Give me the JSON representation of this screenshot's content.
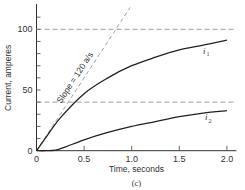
{
  "chart_data": {
    "type": "line",
    "title": "",
    "caption": "(c)",
    "xlabel": "Time, seconds",
    "ylabel": "Current, amperes",
    "xlim": [
      0,
      2.1
    ],
    "ylim": [
      0,
      120
    ],
    "x_ticks": [
      "0",
      "0.5",
      "1.0",
      "1.5",
      "2.0"
    ],
    "y_ticks": [
      "0",
      "50",
      "100"
    ],
    "y_minor_tick_step": 10,
    "grid": false,
    "reference_lines": [
      {
        "type": "horizontal",
        "y": 100,
        "style": "dashed"
      },
      {
        "type": "horizontal",
        "y": 40,
        "style": "dashed"
      },
      {
        "type": "slope",
        "slope": 120,
        "label": "Slope = 120 a/s",
        "style": "dashed"
      }
    ],
    "series": [
      {
        "name": "i1",
        "label": "i",
        "subscript": "1",
        "x": [
          0,
          0.1,
          0.25,
          0.5,
          0.75,
          1.0,
          1.25,
          1.5,
          1.75,
          2.0
        ],
        "values": [
          0,
          11,
          27,
          47,
          60,
          70,
          77,
          83,
          87,
          91
        ]
      },
      {
        "name": "i2",
        "label": "i",
        "subscript": "2",
        "x": [
          0,
          0.1,
          0.2,
          0.3,
          0.5,
          0.75,
          1.0,
          1.25,
          1.5,
          1.75,
          2.0
        ],
        "values": [
          0,
          0,
          0.5,
          3,
          9,
          15,
          20,
          24,
          28,
          31,
          33
        ]
      }
    ],
    "legend": "inline labels"
  }
}
